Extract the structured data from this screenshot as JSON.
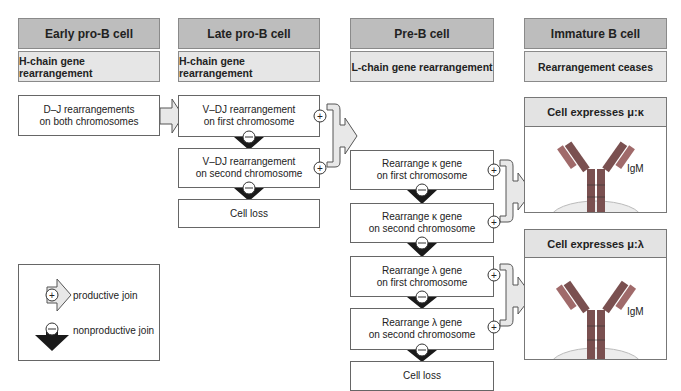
{
  "columns": [
    {
      "stage": "Early pro-B cell",
      "process": "H-chain gene rearrangement"
    },
    {
      "stage": "Late pro-B cell",
      "process": "H-chain gene rearrangement"
    },
    {
      "stage": "Pre-B cell",
      "process": "L-chain gene rearrangement"
    },
    {
      "stage": "Immature B cell",
      "process": "Rearrangement ceases"
    }
  ],
  "early": {
    "line1": "D–J rearrangements",
    "line2": "on both chromosomes"
  },
  "late": [
    {
      "line1": "V–DJ rearrangement",
      "line2": "on first chromosome"
    },
    {
      "line1": "V–DJ rearrangement",
      "line2": "on second chromosome"
    },
    {
      "line1": "Cell loss",
      "line2": ""
    }
  ],
  "preb": [
    {
      "line1": "Rearrange κ gene",
      "line2": "on first chromosome"
    },
    {
      "line1": "Rearrange κ gene",
      "line2": "on second chromosome"
    },
    {
      "line1": "Rearrange λ gene",
      "line2": "on first chromosome"
    },
    {
      "line1": "Rearrange λ gene",
      "line2": "on second chromosome"
    },
    {
      "line1": "Cell loss",
      "line2": ""
    }
  ],
  "immature": [
    {
      "title": "Cell expresses μ:κ",
      "antibody_label": "IgM"
    },
    {
      "title": "Cell expresses μ:λ",
      "antibody_label": "IgM"
    }
  ],
  "legend": {
    "productive": "productive join",
    "nonproductive": "nonproductive join",
    "plus_symbol": "+",
    "minus_symbol": "−"
  },
  "colors": {
    "header_bg": "#bdbdbd",
    "subheader_bg": "#e6e6e6",
    "productive_arrow": "#e8e8e8",
    "nonproductive_arrow": "#1a1a1a",
    "heavy_chain": "#7a5050",
    "light_chain": "#a06a6a",
    "membrane": "#ececec"
  }
}
